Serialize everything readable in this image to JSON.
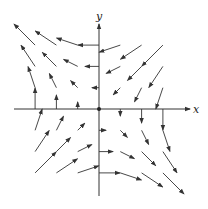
{
  "diagram": {
    "type": "vector_field",
    "field_expression": "F(x, y) = -y i - x j",
    "axes": {
      "x_label": "x",
      "y_label": "y"
    },
    "grid": {
      "x_range": [
        -3,
        3
      ],
      "y_range": [
        -3,
        3
      ],
      "step": 1
    },
    "colors": {
      "axis": "#333333",
      "arrow": "#333333",
      "background": "#ffffff"
    }
  }
}
